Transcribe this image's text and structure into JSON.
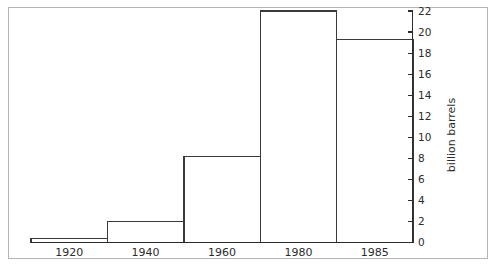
{
  "chart_data": {
    "type": "bar",
    "title": "",
    "subtitle": "",
    "xlabel": "",
    "ylabel": "billion barrels",
    "categories": [
      "1920",
      "1940",
      "1960",
      "1980",
      "1985"
    ],
    "values": [
      0.4,
      2.0,
      8.2,
      22.0,
      19.3
    ],
    "ylim": [
      0,
      22
    ],
    "ytick_labels": [
      "0",
      "2",
      "4",
      "6",
      "8",
      "10",
      "12",
      "14",
      "16",
      "18",
      "20",
      "22"
    ],
    "ytick_values": [
      0,
      2,
      4,
      6,
      8,
      10,
      12,
      14,
      16,
      18,
      20,
      22
    ],
    "xtick_labels": [
      "1920",
      "1940",
      "1960",
      "1980",
      "1985"
    ],
    "grid": false,
    "legend": false,
    "legend_position": "none",
    "y_axis_side": "right",
    "bar_style": "outline",
    "bar_fill_color": "#ffffff",
    "bar_edge_color": "#3a3a3a",
    "axis_color": "#2b2b2b",
    "frame_color": "#b4b4b4",
    "background_color": "#ffffff",
    "annotations": []
  },
  "figure": {
    "frame_label": "chart-frame",
    "plot_label": "bar-chart-plot"
  }
}
